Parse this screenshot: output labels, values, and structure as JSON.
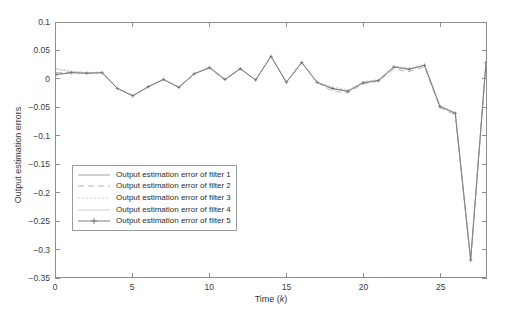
{
  "chart_data": {
    "type": "line",
    "title": "",
    "xlabel": "Time (k)",
    "ylabel": "Output estimation errors",
    "xlim": [
      0,
      28
    ],
    "ylim": [
      -0.35,
      0.1
    ],
    "xticks": [
      0,
      5,
      10,
      15,
      20,
      25
    ],
    "xtick_labels": [
      "0",
      "5",
      "10",
      "15",
      "20",
      "25"
    ],
    "yticks": [
      0.1,
      0.05,
      0,
      -0.05,
      -0.1,
      -0.15,
      -0.2,
      -0.25,
      -0.3,
      -0.35
    ],
    "ytick_labels": [
      "0.1",
      "0.05",
      "0",
      "-0.05",
      "-0.1",
      "-0.15",
      "-0.2",
      "-0.25",
      "-0.3",
      "-0.35"
    ],
    "grid": false,
    "legend_position": "lower-left",
    "x": [
      0,
      1,
      2,
      3,
      4,
      5,
      6,
      7,
      8,
      9,
      10,
      11,
      12,
      13,
      14,
      15,
      16,
      17,
      18,
      19,
      20,
      21,
      22,
      23,
      24,
      25,
      26,
      27,
      28
    ],
    "series": [
      {
        "name": "Output estimation error of filter 1",
        "style": "solid",
        "color": "#9a9a9a",
        "values": [
          0.008,
          0.012,
          0.011,
          0.012,
          -0.016,
          -0.029,
          -0.013,
          0.0,
          -0.014,
          0.01,
          0.021,
          0.0,
          0.019,
          -0.001,
          0.041,
          -0.005,
          0.03,
          -0.005,
          -0.017,
          -0.021,
          -0.006,
          -0.002,
          0.022,
          0.018,
          0.025,
          -0.048,
          -0.06,
          -0.32,
          0.03
        ]
      },
      {
        "name": "Output estimation error of filter 2",
        "style": "dashed",
        "color": "#a8a8a8",
        "values": [
          0.012,
          0.013,
          0.011,
          0.012,
          -0.016,
          -0.029,
          -0.013,
          0.0,
          -0.014,
          0.01,
          0.02,
          -0.001,
          0.018,
          -0.001,
          0.041,
          -0.005,
          0.03,
          -0.005,
          -0.021,
          -0.024,
          -0.008,
          -0.003,
          0.018,
          0.014,
          0.022,
          -0.05,
          -0.063,
          -0.322,
          0.029
        ]
      },
      {
        "name": "Output estimation error of filter 3",
        "style": "dotted",
        "color": "#bdbdbd",
        "values": [
          0.02,
          0.015,
          0.012,
          0.013,
          -0.016,
          -0.029,
          -0.013,
          0.0,
          -0.014,
          0.011,
          0.022,
          0.0,
          0.02,
          -0.001,
          0.042,
          -0.005,
          0.031,
          -0.005,
          -0.013,
          -0.018,
          -0.004,
          0.0,
          0.024,
          0.02,
          0.027,
          -0.046,
          -0.058,
          -0.318,
          0.031
        ]
      },
      {
        "name": "Output estimation error of filter 4",
        "style": "faint-solid",
        "color": "#c9c9c9",
        "values": [
          0.018,
          0.014,
          0.012,
          0.013,
          -0.016,
          -0.029,
          -0.013,
          0.0,
          -0.014,
          0.01,
          0.021,
          0.0,
          0.019,
          -0.001,
          0.041,
          -0.005,
          0.03,
          -0.005,
          -0.015,
          -0.02,
          -0.005,
          -0.001,
          0.023,
          0.019,
          0.026,
          -0.047,
          -0.059,
          -0.319,
          0.03
        ]
      },
      {
        "name": "Output estimation error of filter 5",
        "style": "solid-marker",
        "color": "#6f6f6f",
        "marker": "+",
        "values": [
          0.009,
          0.012,
          0.011,
          0.012,
          -0.016,
          -0.029,
          -0.013,
          0.0,
          -0.014,
          0.01,
          0.021,
          0.0,
          0.019,
          -0.001,
          0.041,
          -0.005,
          0.03,
          -0.005,
          -0.016,
          -0.021,
          -0.006,
          -0.002,
          0.022,
          0.018,
          0.025,
          -0.048,
          -0.06,
          -0.32,
          0.03
        ]
      }
    ]
  },
  "legend": {
    "items": [
      {
        "label": "Output estimation error of filter 1"
      },
      {
        "label": "Output estimation error of filter 2"
      },
      {
        "label": "Output estimation error of filter 3"
      },
      {
        "label": "Output estimation error of filter 4"
      },
      {
        "label": "Output estimation error of filter 5"
      }
    ]
  }
}
